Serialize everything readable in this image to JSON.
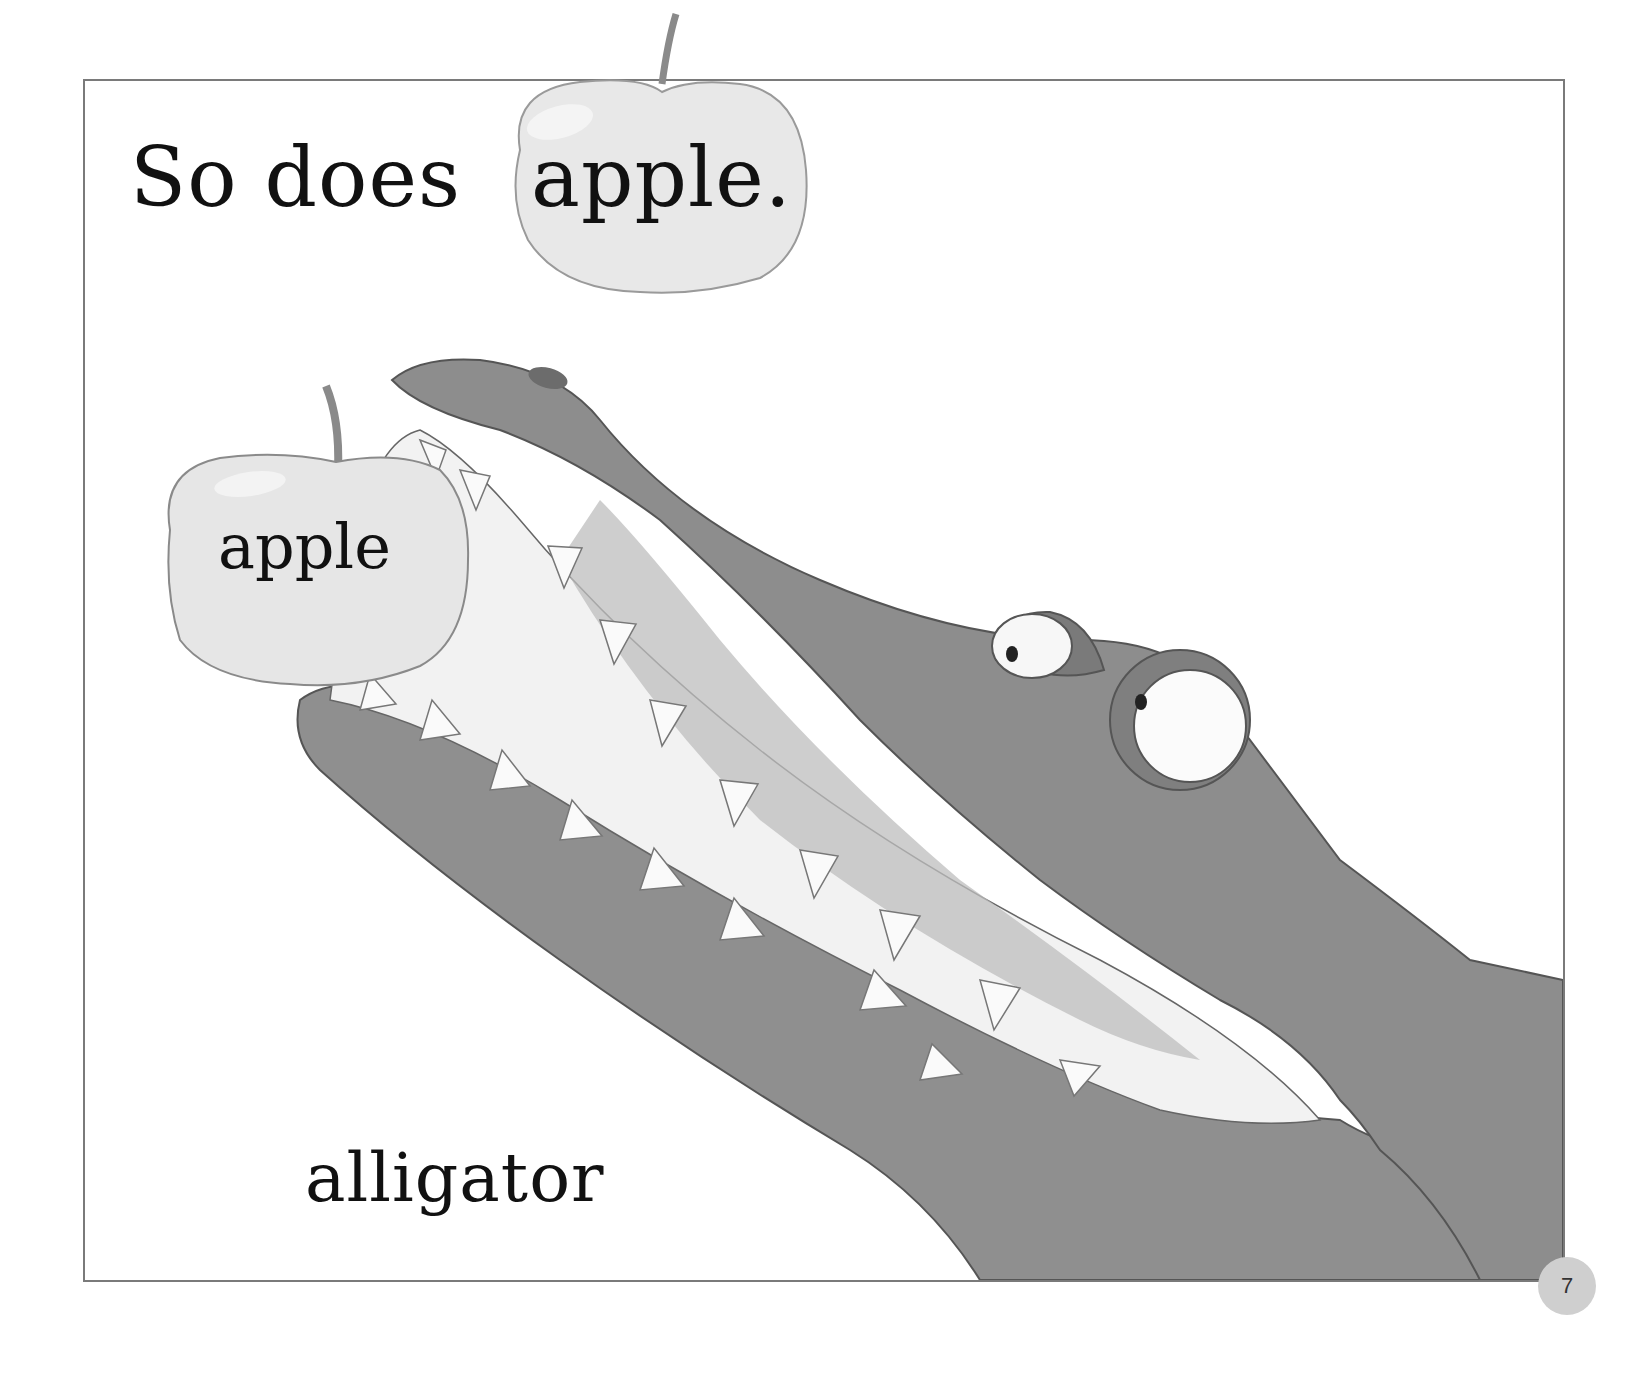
{
  "page": {
    "sentence": {
      "prefix": "So does",
      "highlight_word": "apple."
    },
    "labels": {
      "apple": "apple",
      "alligator": "alligator"
    },
    "page_number": "7",
    "colors": {
      "frame_border": "#7a7a7a",
      "alligator_body": "#8e8e8e",
      "alligator_dark": "#6f6f6f",
      "apple_fill": "#e6e6e6",
      "teeth": "#fafafa",
      "page_number_badge": "#cfcfcf"
    }
  }
}
